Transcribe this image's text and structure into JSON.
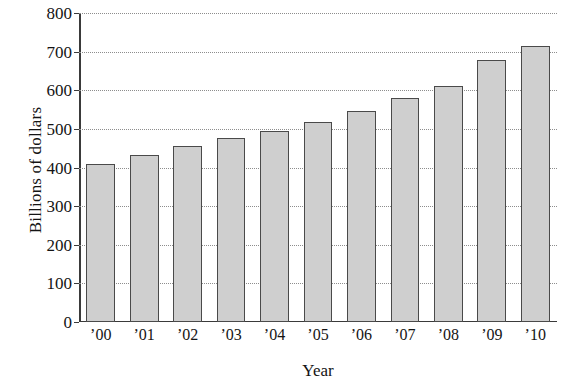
{
  "chart_data": {
    "type": "bar",
    "title": "",
    "subtitle": "",
    "xlabel": "Year",
    "ylabel": "Billions of dollars",
    "categories": [
      "’00",
      "’01",
      "’02",
      "’03",
      "’04",
      "’05",
      "’06",
      "’07",
      "’08",
      "’09",
      "’10"
    ],
    "values": [
      410,
      433,
      456,
      476,
      495,
      518,
      547,
      580,
      612,
      678,
      715
    ],
    "ylim": [
      0,
      800
    ],
    "ytick_labels": [
      "0",
      "100",
      "200",
      "300",
      "400",
      "500",
      "600",
      "700",
      "800"
    ],
    "ytick_values": [
      0,
      100,
      200,
      300,
      400,
      500,
      600,
      700,
      800
    ],
    "grid": true,
    "grid_style": "dotted-horizontal",
    "legend": null,
    "legend_position": "none",
    "bar_fill_color": "#cfcfcf",
    "bar_edge_color": "#4a4a4a",
    "axis_color": "#3a3a3a",
    "grid_color": "#8d8d8d",
    "background_color": "#ffffff"
  }
}
